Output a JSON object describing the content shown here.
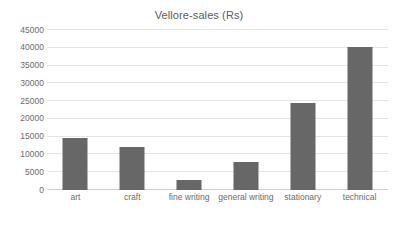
{
  "chart_data": {
    "type": "bar",
    "title": "Vellore-sales (Rs)",
    "xlabel": "",
    "ylabel": "",
    "categories": [
      "art",
      "craft",
      "fine writing",
      "general writing",
      "stationary",
      "technical"
    ],
    "values": [
      14500,
      12100,
      2800,
      7800,
      24400,
      40200
    ],
    "series": [
      {
        "name": "Vellore-sales (Rs)",
        "values": [
          14500,
          12100,
          2800,
          7800,
          24400,
          40200
        ]
      }
    ],
    "ylim": [
      0,
      45000
    ],
    "y_ticks": [
      0,
      5000,
      10000,
      15000,
      20000,
      25000,
      30000,
      35000,
      40000,
      45000
    ],
    "y_tick_labels": [
      "0",
      "5000",
      "10000",
      "15000",
      "20000",
      "25000",
      "30000",
      "35000",
      "40000",
      "45000"
    ],
    "grid": true,
    "legend": false,
    "legend_position": "none",
    "bar_color": "#676767",
    "gridline_color": "#e4e4e4",
    "background_color": "#ffffff",
    "text_color": "#6b6b6b"
  }
}
